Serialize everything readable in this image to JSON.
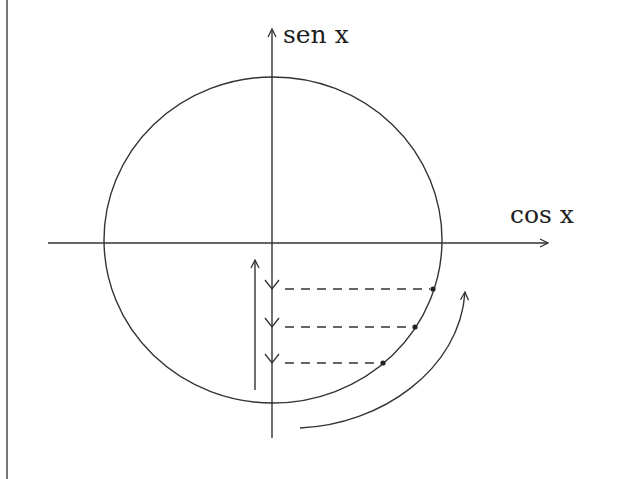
{
  "diagram": {
    "y_axis_label": "sen x",
    "x_axis_label": "cos x",
    "stroke_color": "#333333",
    "background": "#ffffff",
    "circle": {
      "cx": 273,
      "cy": 240,
      "rx": 169,
      "ry": 163
    },
    "points": [
      {
        "x": 433,
        "y": 289
      },
      {
        "x": 415,
        "y": 327
      },
      {
        "x": 383,
        "y": 363
      }
    ],
    "projection_arrows_count": 3,
    "annotations": [
      "dashed projections from circle points to vertical axis",
      "downward arrows on vertical axis",
      "upward arrow left of vertical axis",
      "curved arrow along circle (counterclockwise)"
    ]
  }
}
